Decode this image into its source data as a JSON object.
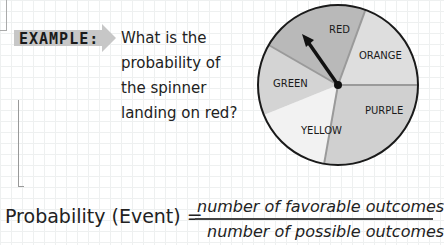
{
  "example": {
    "tag": "EXAMPLE:",
    "question_lines": [
      "What is the",
      "probability of",
      "the spinner",
      "landing on red?"
    ]
  },
  "spinner": {
    "segments": [
      {
        "label": "RED",
        "color": "#b9b9b9"
      },
      {
        "label": "ORANGE",
        "color": "#dcdcdc"
      },
      {
        "label": "PURPLE",
        "color": "#cfcfcf"
      },
      {
        "label": "YELLOW",
        "color": "#f1f1f1"
      },
      {
        "label": "GREEN",
        "color": "#d3d3d3"
      }
    ],
    "pointer_target": "RED"
  },
  "formula": {
    "lhs": "Probability (Event) =",
    "numerator": "number of favorable outcomes",
    "denominator": "number of possible outcomes"
  }
}
